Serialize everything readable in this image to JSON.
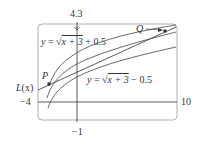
{
  "figure": {
    "type": "graph",
    "window": {
      "xmin": -4,
      "xmax": 10,
      "ymin": -1,
      "ymax": 4.3
    },
    "tick_labels": {
      "left": "−4",
      "right": "10",
      "bottom": "−1",
      "top": "4.3"
    },
    "curves": [
      {
        "label": "y = √(x + 3) + 0.5",
        "expr": "sqrt(x+3)+0.5"
      },
      {
        "label": "y = √(x + 3)",
        "expr": "sqrt(x+3)"
      },
      {
        "label": "y = √(x + 3) − 0.5",
        "expr": "sqrt(x+3)-0.5"
      }
    ],
    "line_label": "L(x)",
    "points": [
      {
        "name": "P"
      },
      {
        "name": "Q"
      }
    ],
    "colors": {
      "ink": "#333333",
      "box": "#999999"
    }
  },
  "labels": {
    "upper_curve_y": "y",
    "upper_curve_eq": "=",
    "upper_curve_rad": "x + 3",
    "upper_curve_tail": "+ 0.5",
    "lower_curve_y": "y",
    "lower_curve_eq": "=",
    "lower_curve_rad": "x + 3",
    "lower_curve_tail": "− 0.5",
    "L": "L",
    "Lx": "(x)",
    "P": "P",
    "Q": "Q",
    "xmin": "−4",
    "xmax": "10",
    "ymin": "−1",
    "ymax": "4.3"
  }
}
